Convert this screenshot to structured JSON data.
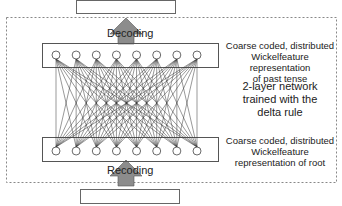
{
  "diagram": {
    "top_label": "Decoding",
    "bottom_label": "Recoding",
    "output_layer_desc": "Coarse coded, distributed Wickelfeature representation of past tense",
    "output_layer_lines": [
      "Coarse coded, distributed",
      "Wickelfeature representation",
      "of past tense"
    ],
    "network_desc_lines": [
      "2-layer network",
      "trained with the",
      "delta rule"
    ],
    "input_layer_lines": [
      "Coarse coded, distributed",
      "Wickelfeature",
      "representation of root"
    ],
    "units_per_layer": 8,
    "colors": {
      "arrow": "#8c8c8c",
      "line": "#333333",
      "dash": "#888888"
    }
  }
}
